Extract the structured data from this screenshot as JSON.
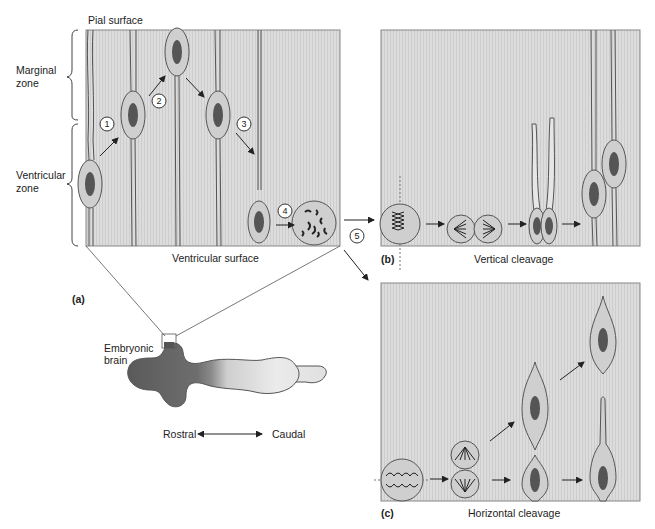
{
  "colors": {
    "panel_fill": "#d9d9d9",
    "panel_stroke": "#888888",
    "cell_fill": "#cfcfcf",
    "nucleus": "#555555",
    "text": "#222222"
  },
  "panel_a": {
    "label": "(a)",
    "top_label": "Pial surface",
    "bottom_label": "Ventricular surface",
    "zones": [
      "Marginal zone",
      "Ventricular zone"
    ],
    "zone_lines": {
      "marginal": [
        "Marginal",
        "zone"
      ],
      "ventricular": [
        "Ventricular",
        "zone"
      ]
    },
    "steps": [
      "1",
      "2",
      "3",
      "4",
      "5"
    ],
    "brain_label": [
      "Embryonic",
      "brain"
    ],
    "axis": {
      "left": "Rostral",
      "right": "Caudal"
    }
  },
  "panel_b": {
    "label": "(b)",
    "caption": "Vertical cleavage"
  },
  "panel_c": {
    "label": "(c)",
    "caption": "Horizontal cleavage"
  }
}
